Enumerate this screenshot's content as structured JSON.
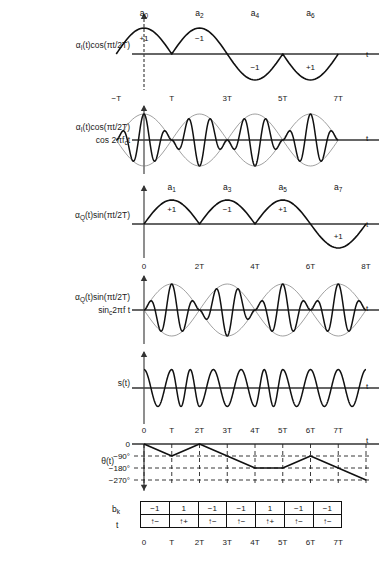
{
  "figure": {
    "axis_label_t": "t",
    "rows": [
      {
        "id": "row-i-baseband",
        "label_lines": [
          "α_I(t)cos(πt/2T)"
        ],
        "label_html": "α<span class='sub'>I</span>(t)cos(πt/2T)",
        "type": "halfsine",
        "symbol_marks": [
          "a0",
          "a2",
          "a4",
          "a6"
        ],
        "symbol_marks_html": [
          "a<span class='sub'>0</span>",
          "a<span class='sub'>2</span>",
          "a<span class='sub'>4</span>",
          "a<span class='sub'>6</span>"
        ],
        "values": [
          "+1",
          "−1",
          "−1",
          "+1"
        ],
        "signs": [
          1,
          1,
          -1,
          -1
        ],
        "ticks": [
          "−T",
          "T",
          "3T",
          "5T",
          "7T"
        ],
        "tick_positions": [
          0,
          1,
          2,
          3,
          4
        ]
      },
      {
        "id": "row-i-carrier",
        "label_html": "α<span class='sub'>I</span>(t)cos(πt/2T)<br>cos 2πf<span class='sub'>c</span>t",
        "label_lines": [
          "α_I(t)cos(πt/2T)",
          "cos 2πf_c t"
        ],
        "type": "modulated",
        "signs": [
          1,
          1,
          -1,
          -1
        ],
        "ticks": [],
        "carrier_cycles_per_symbol": 2.5
      },
      {
        "id": "row-q-baseband",
        "label_html": "α<span class='sub'>Q</span>(t)sin(πt/2T)",
        "label_lines": [
          "α_Q(t)sin(πt/2T)"
        ],
        "type": "halfsine",
        "symbol_marks": [
          "a1",
          "a3",
          "a5",
          "a7"
        ],
        "symbol_marks_html": [
          "a<span class='sub'>1</span>",
          "a<span class='sub'>3</span>",
          "a<span class='sub'>5</span>",
          "a<span class='sub'>7</span>"
        ],
        "values": [
          "+1",
          "−1",
          "+1",
          "+1"
        ],
        "signs": [
          1,
          1,
          1,
          -1
        ],
        "ticks": [
          "0",
          "2T",
          "4T",
          "6T",
          "8T"
        ],
        "tick_positions": [
          0,
          1,
          2,
          3,
          4
        ]
      },
      {
        "id": "row-q-carrier",
        "label_html": "α<span class='sub'>Q</span>(t)sin(πt/2T)<br>sin<span class='sub'>c</span>2πf t",
        "label_lines": [
          "α_Q(t)sin(πt/2T)",
          "sin_c 2πf t"
        ],
        "type": "modulated",
        "signs": [
          1,
          1,
          1,
          -1
        ],
        "ticks": [],
        "carrier_cycles_per_symbol": 2.5
      },
      {
        "id": "row-s",
        "label_html": "s(t)",
        "label_lines": [
          "s(t)"
        ],
        "type": "composite",
        "ticks": [
          "0",
          "T",
          "2T",
          "3T",
          "4T",
          "5T",
          "6T",
          "7T"
        ],
        "carrier_cycles_per_symbol": 2.5
      }
    ],
    "phase": {
      "id": "row-phase",
      "label_html": "θ(t)",
      "label_lines": [
        "θ(t)"
      ],
      "axis_labels": [
        "0",
        "−90°",
        "−180°",
        "−270°"
      ],
      "axis_levels": [
        0,
        -90,
        -180,
        -270
      ],
      "trajectory": [
        0,
        -90,
        0,
        -90,
        -180,
        -180,
        -90,
        -180,
        -270
      ]
    },
    "bit_table": {
      "row_label_html": "b<span class='sub'>k</span>",
      "row_label": "b_k",
      "second_row_label": "t",
      "bk": [
        "−1",
        "1",
        "−1",
        "−1",
        "1",
        "−1",
        "−1"
      ],
      "transitions": [
        "↑−",
        "↑+",
        "↑−",
        "↑−",
        "↑+",
        "↑−",
        "↑−"
      ],
      "ticks": [
        "0",
        "T",
        "2T",
        "3T",
        "4T",
        "5T",
        "6T",
        "7T"
      ]
    }
  }
}
